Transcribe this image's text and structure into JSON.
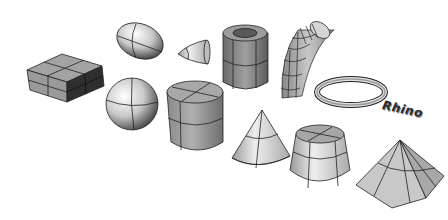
{
  "scene": {
    "description": "Rendered 3D primitive shapes on white background",
    "background": "#ffffff",
    "shape_fill": "#a9a9a9",
    "shape_dark": "#3a3a3a",
    "shape_light": "#eeeeee",
    "edge_color": "#222222",
    "objects": [
      {
        "name": "box",
        "label": "Box"
      },
      {
        "name": "ellipsoid",
        "label": "Ellipsoid"
      },
      {
        "name": "paraboloid",
        "label": "Paraboloid"
      },
      {
        "name": "tube",
        "label": "Tube"
      },
      {
        "name": "pipe",
        "label": "Pipe"
      },
      {
        "name": "sphere",
        "label": "Sphere"
      },
      {
        "name": "cylinder",
        "label": "Cylinder"
      },
      {
        "name": "cone",
        "label": "Cone"
      },
      {
        "name": "torus",
        "label": "Torus"
      },
      {
        "name": "text-object",
        "label": "Rhino"
      },
      {
        "name": "truncated-cone",
        "label": "Truncated Cone"
      },
      {
        "name": "pyramid",
        "label": "Pyramid"
      }
    ]
  },
  "text_object": {
    "text": "Rhino"
  }
}
